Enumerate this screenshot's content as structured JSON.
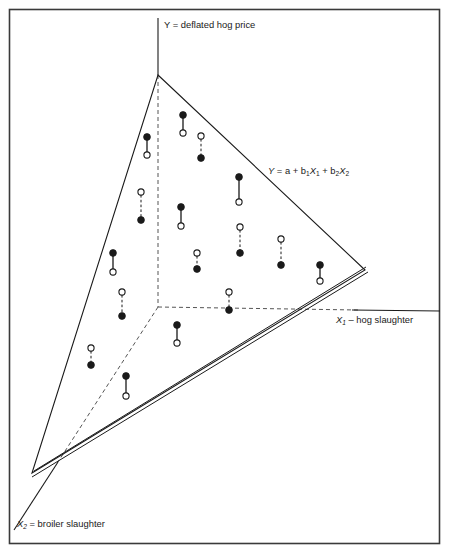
{
  "figure": {
    "background_color": "#ffffff",
    "frame_color": "#3a3a3a",
    "line_color": "#1a1a1a",
    "observed_marker": "filled-circle",
    "predicted_marker": "open-circle"
  },
  "labels": {
    "y_axis": "Y = deflated hog price",
    "x1_axis_italic": "X",
    "x1_axis_sub": "1",
    "x1_axis_rest": " – hog slaughter",
    "x2_axis_italic": "X",
    "x2_axis_sub": "2",
    "x2_axis_rest": " = broiler slaughter",
    "plane_eq_y": "Y",
    "plane_eq_mid": " = a + b",
    "plane_eq_sub1": "1",
    "plane_eq_x1": "X",
    "plane_eq_sub1b": "1",
    "plane_eq_plus": " + b",
    "plane_eq_sub2": "2",
    "plane_eq_x2": "X",
    "plane_eq_sub2b": "2"
  },
  "chart_data": {
    "type": "scatter",
    "xlabel": "X1 – hog slaughter",
    "ylabel": "Y = deflated hog price",
    "zlabel": "X2 = broiler slaughter",
    "legend": [
      "Observed value (filled circle)",
      "Predicted value on plane (open circle)",
      "Residual (connecting segment)"
    ],
    "grid": false,
    "annotations": [
      "Y = a + b1X1 + b2X2"
    ],
    "plane_vertices": [
      [
        158,
        75
      ],
      [
        365,
        270
      ],
      [
        32,
        473
      ]
    ],
    "axes": {
      "y_axis": {
        "x1": 158,
        "y1": 18,
        "x2": 158,
        "y2": 75
      },
      "y_axis_hidden": {
        "x1": 158,
        "y1": 75,
        "x2": 158,
        "y2": 307,
        "style": "dashed"
      },
      "x1_axis_visible": {
        "x1": 357,
        "y1": 311,
        "x2": 443,
        "y2": 311
      },
      "x1_axis_hidden": {
        "x1": 158,
        "y1": 307,
        "x2": 357,
        "y2": 310,
        "style": "dashed"
      },
      "x2_axis_hidden": {
        "x1": 158,
        "y1": 307,
        "x2": 55,
        "y2": 465,
        "style": "dashed"
      },
      "x2_axis_visible": {
        "x1": 55,
        "y1": 465,
        "x2": 10,
        "y2": 535
      }
    },
    "plane_edge_double_line": {
      "from": [
        32,
        473
      ],
      "to": [
        365,
        270
      ]
    },
    "points": [
      {
        "id": 1,
        "x": 183,
        "y_observed": 115,
        "y_predicted": 133,
        "residual": "positive",
        "connector": "solid"
      },
      {
        "id": 2,
        "x": 201,
        "y_observed": 158,
        "y_predicted": 136,
        "residual": "negative",
        "connector": "dashed"
      },
      {
        "id": 3,
        "x": 147,
        "y_observed": 137,
        "y_predicted": 155,
        "residual": "positive",
        "connector": "solid"
      },
      {
        "id": 4,
        "x": 239,
        "y_observed": 177,
        "y_predicted": 202,
        "residual": "positive",
        "connector": "solid"
      },
      {
        "id": 5,
        "x": 141,
        "y_observed": 220,
        "y_predicted": 192,
        "residual": "negative",
        "connector": "dashed"
      },
      {
        "id": 6,
        "x": 181,
        "y_observed": 207,
        "y_predicted": 226,
        "residual": "positive",
        "connector": "solid"
      },
      {
        "id": 7,
        "x": 240,
        "y_observed": 253,
        "y_predicted": 227,
        "residual": "negative",
        "connector": "dashed"
      },
      {
        "id": 8,
        "x": 113,
        "y_observed": 253,
        "y_predicted": 272,
        "residual": "positive",
        "connector": "solid"
      },
      {
        "id": 9,
        "x": 197,
        "y_observed": 269,
        "y_predicted": 253,
        "residual": "negative",
        "connector": "dashed"
      },
      {
        "id": 10,
        "x": 281,
        "y_observed": 265,
        "y_predicted": 239,
        "residual": "negative",
        "connector": "dashed"
      },
      {
        "id": 11,
        "x": 320,
        "y_observed": 265,
        "y_predicted": 281,
        "residual": "positive",
        "connector": "solid"
      },
      {
        "id": 12,
        "x": 122,
        "y_observed": 316,
        "y_predicted": 292,
        "residual": "negative",
        "connector": "dashed"
      },
      {
        "id": 13,
        "x": 229,
        "y_observed": 310,
        "y_predicted": 292,
        "residual": "negative",
        "connector": "dashed"
      },
      {
        "id": 14,
        "x": 177,
        "y_observed": 325,
        "y_predicted": 343,
        "residual": "positive",
        "connector": "solid"
      },
      {
        "id": 15,
        "x": 91,
        "y_observed": 365,
        "y_predicted": 348,
        "residual": "negative",
        "connector": "dashed"
      },
      {
        "id": 16,
        "x": 126,
        "y_observed": 376,
        "y_predicted": 396,
        "residual": "positive",
        "connector": "solid"
      }
    ]
  }
}
